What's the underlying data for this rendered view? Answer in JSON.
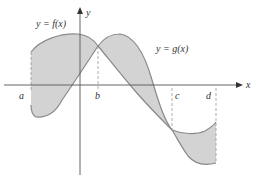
{
  "labels": {
    "f": "y = f(x)",
    "g": "y = g(x)",
    "x_axis": "x",
    "y_axis": "y",
    "a": "a",
    "b": "b",
    "c": "c",
    "d": "d"
  },
  "colors": {
    "shade": "#d3d3d3",
    "curve": "#8a8a8a",
    "axis": "#555555"
  }
}
